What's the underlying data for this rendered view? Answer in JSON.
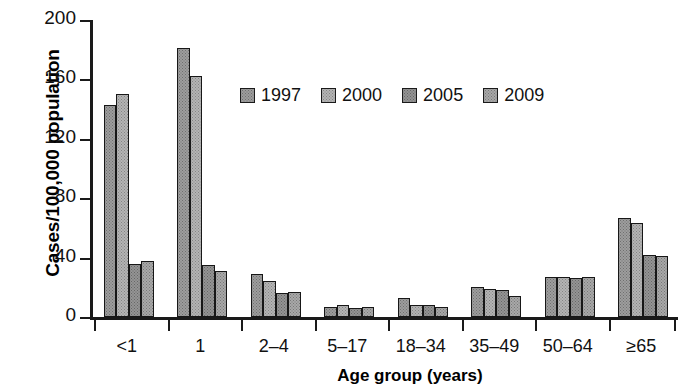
{
  "chart_data": {
    "type": "bar",
    "title": "",
    "subtitle": "",
    "xlabel": "Age group (years)",
    "ylabel": "Cases/100,000 population",
    "categories": [
      "<1",
      "1",
      "2–4",
      "5–17",
      "18–34",
      "35–49",
      "50–64",
      "≥65"
    ],
    "series": [
      {
        "name": "1997",
        "color": "#9d9d9d",
        "values": [
          143,
          181,
          29,
          7,
          13,
          20,
          27,
          67
        ]
      },
      {
        "name": "2000",
        "color": "#b4b4b4",
        "values": [
          150,
          162,
          24,
          8,
          8,
          19,
          27,
          63
        ]
      },
      {
        "name": "2005",
        "color": "#949494",
        "values": [
          36,
          35,
          16,
          6,
          8,
          18,
          26,
          42
        ]
      },
      {
        "name": "2009",
        "color": "#a8a8a8",
        "values": [
          38,
          31,
          17,
          7,
          7,
          14,
          27,
          41
        ]
      }
    ],
    "ylim": [
      0,
      200
    ],
    "yticks": [
      0,
      40,
      80,
      120,
      160,
      200
    ],
    "ytick_labels": [
      "0",
      "40",
      "80",
      "120",
      "160",
      "200"
    ],
    "grid": false,
    "legend_position": "upper-center",
    "legend_entries": [
      "1997",
      "2000",
      "2005",
      "2009"
    ]
  }
}
